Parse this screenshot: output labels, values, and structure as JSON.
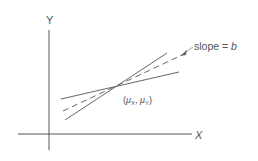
{
  "diagram": {
    "axes": {
      "y_label": "Y",
      "x_label": "X"
    },
    "annotations": {
      "slope_label_prefix": "slope = ",
      "slope_label_var": "b",
      "point_label": "(μX, μY)"
    },
    "point": {
      "mu_open": "(",
      "mu": "μ",
      "sub_x": "X",
      "sep": ", ",
      "sub_y": "Y",
      "mu_close": ")"
    },
    "colors": {
      "line": "#666666",
      "text": "#555555"
    }
  }
}
